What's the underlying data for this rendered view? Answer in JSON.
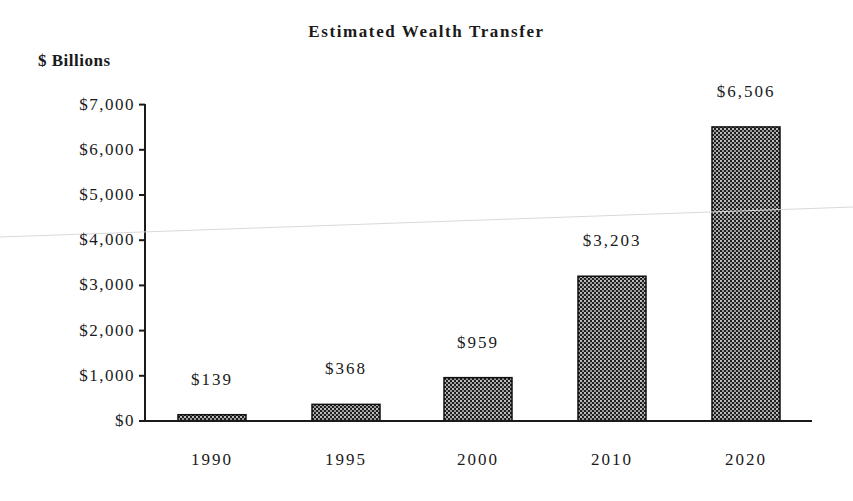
{
  "chart_data": {
    "type": "bar",
    "title": "Estimated Wealth Transfer",
    "ylabel": "$ Billions",
    "xlabel": "",
    "categories": [
      "1990",
      "1995",
      "2000",
      "2010",
      "2020"
    ],
    "values": [
      139,
      368,
      959,
      3203,
      6506
    ],
    "value_labels": [
      "$139",
      "$368",
      "$959",
      "$3,203",
      "$6,506"
    ],
    "ylim": [
      0,
      7000
    ],
    "yticks": [
      0,
      1000,
      2000,
      3000,
      4000,
      5000,
      6000,
      7000
    ],
    "ytick_labels": [
      "$0",
      "$1,000",
      "$2,000",
      "$3,000",
      "$4,000",
      "$5,000",
      "$6,000",
      "$7,000"
    ],
    "grid": false,
    "legend": null,
    "bar_fill": "crosshatch-dotted",
    "bar_color": "#2a2a2a"
  },
  "header": {
    "title": "Estimated Wealth Transfer",
    "unit_label": "$ Billions"
  }
}
